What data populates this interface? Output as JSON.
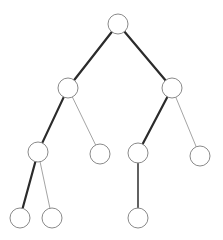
{
  "figure": {
    "background_color": "#ffffff",
    "width": 223,
    "height": 240
  },
  "style": {
    "node_fill": "#ffffff",
    "node_stroke": "#8a8a8a",
    "node_stroke_width": 1,
    "node_radius": 10,
    "edge_color_thick": "#2b2b2b",
    "edge_color_thin": "#9a9a9a",
    "edge_width_thick": 2.2,
    "edge_width_medium": 1.6,
    "edge_width_thin": 0.9
  },
  "chart_data": {
    "type": "diagram",
    "subtype": "node-link-tree",
    "node_count": 11,
    "edge_count": 10,
    "depth": 4,
    "nodes": [
      {
        "id": "n0",
        "label": "",
        "x": 118,
        "y": 24,
        "r": 10,
        "depth": 0,
        "role": "root"
      },
      {
        "id": "n1",
        "label": "",
        "x": 68,
        "y": 88,
        "r": 10,
        "depth": 1,
        "role": "internal"
      },
      {
        "id": "n2",
        "label": "",
        "x": 172,
        "y": 88,
        "r": 10,
        "depth": 1,
        "role": "internal"
      },
      {
        "id": "n3",
        "label": "",
        "x": 38,
        "y": 152,
        "r": 10,
        "depth": 2,
        "role": "internal"
      },
      {
        "id": "n4",
        "label": "",
        "x": 100,
        "y": 154,
        "r": 10,
        "depth": 2,
        "role": "leaf"
      },
      {
        "id": "n5",
        "label": "",
        "x": 138,
        "y": 153,
        "r": 10,
        "depth": 2,
        "role": "internal"
      },
      {
        "id": "n6",
        "label": "",
        "x": 200,
        "y": 156,
        "r": 10,
        "depth": 2,
        "role": "leaf"
      },
      {
        "id": "n7",
        "label": "",
        "x": 20,
        "y": 218,
        "r": 10,
        "depth": 3,
        "role": "leaf"
      },
      {
        "id": "n8",
        "label": "",
        "x": 52,
        "y": 218,
        "r": 10,
        "depth": 3,
        "role": "leaf"
      },
      {
        "id": "n9",
        "label": "",
        "x": 138,
        "y": 218,
        "r": 10,
        "depth": 3,
        "role": "leaf"
      }
    ],
    "edges": [
      {
        "id": "e0",
        "from": "n0",
        "to": "n1",
        "weight": "thick",
        "color": "#2b2b2b",
        "width": 2.2
      },
      {
        "id": "e1",
        "from": "n0",
        "to": "n2",
        "weight": "thick",
        "color": "#2b2b2b",
        "width": 2.2
      },
      {
        "id": "e2",
        "from": "n1",
        "to": "n3",
        "weight": "thick",
        "color": "#2b2b2b",
        "width": 2.2
      },
      {
        "id": "e3",
        "from": "n1",
        "to": "n4",
        "weight": "thin",
        "color": "#9a9a9a",
        "width": 0.9
      },
      {
        "id": "e4",
        "from": "n2",
        "to": "n5",
        "weight": "thick",
        "color": "#2b2b2b",
        "width": 2.2
      },
      {
        "id": "e5",
        "from": "n2",
        "to": "n6",
        "weight": "thin",
        "color": "#9a9a9a",
        "width": 0.9
      },
      {
        "id": "e6",
        "from": "n3",
        "to": "n7",
        "weight": "thick",
        "color": "#2b2b2b",
        "width": 2.2
      },
      {
        "id": "e7",
        "from": "n3",
        "to": "n8",
        "weight": "thin",
        "color": "#9a9a9a",
        "width": 0.9
      },
      {
        "id": "e8",
        "from": "n5",
        "to": "n9",
        "weight": "medium",
        "color": "#3a3a3a",
        "width": 1.6
      }
    ],
    "legend": [],
    "annotations": []
  }
}
